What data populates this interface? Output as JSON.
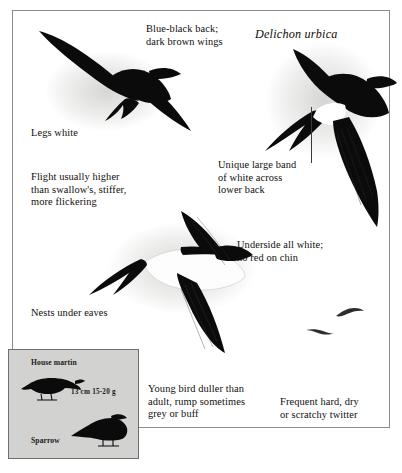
{
  "plate": {
    "scientific_name": "Delichon urbica",
    "captions": [
      {
        "id": "back_wings",
        "text": "Blue-black back;\ndark brown wings"
      },
      {
        "id": "legs",
        "text": "Legs white"
      },
      {
        "id": "flight",
        "text": "Flight usually higher\nthan swallow's, stiffer,\nmore flickering"
      },
      {
        "id": "rump_band",
        "text": "Unique large band\nof white across\nlower back"
      },
      {
        "id": "underside",
        "text": "Underside all white;\nno red on chin"
      },
      {
        "id": "nests",
        "text": "Nests under eaves"
      },
      {
        "id": "young_bird",
        "text": "Young bird duller than\nadult, rump sometimes\ngrey or buff"
      },
      {
        "id": "voice",
        "text": "Frequent hard, dry\nor scratchy twitter"
      }
    ]
  },
  "inset": {
    "species_label": "House martin",
    "comparison_label": "Sparrow",
    "measurements": "13 cm  15-20 g"
  },
  "colors": {
    "bird": "#0b0b0b",
    "border": "#8d8d8d",
    "inset_background": "#d2d2d0",
    "inset_border": "#6f6f6f",
    "text": "#100e0c",
    "leader_line": "#3a3a3a"
  }
}
